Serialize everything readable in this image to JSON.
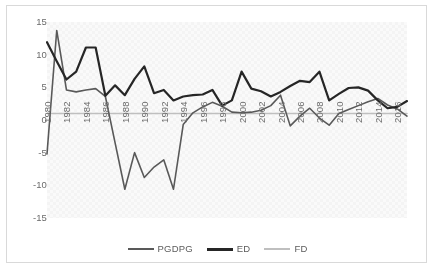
{
  "chart_data": {
    "type": "line",
    "title": "",
    "xlabel": "",
    "ylabel": "",
    "ylim": [
      -15,
      15
    ],
    "y_ticks": [
      15,
      10,
      5,
      0,
      -5,
      -10,
      -15
    ],
    "x_ticks": [
      "1980",
      "1982",
      "1984",
      "1986",
      "1988",
      "1990",
      "1992",
      "1994",
      "1996",
      "1998",
      "2000",
      "2002",
      "2004",
      "2006",
      "2008",
      "2010",
      "2012",
      "2014",
      "2016"
    ],
    "x": [
      1980,
      1981,
      1982,
      1983,
      1984,
      1985,
      1986,
      1987,
      1988,
      1989,
      1990,
      1991,
      1992,
      1993,
      1994,
      1995,
      1996,
      1997,
      1998,
      1999,
      2000,
      2001,
      2002,
      2003,
      2004,
      2005,
      2006,
      2007,
      2008,
      2009,
      2010,
      2011,
      2012,
      2013,
      2014,
      2015,
      2016,
      2017
    ],
    "grid": false,
    "legend_position": "bottom",
    "series": [
      {
        "name": "PGDPG",
        "color": "#595959",
        "width": 1.6,
        "values": [
          -5.2,
          13.7,
          4.6,
          4.3,
          4.6,
          4.8,
          3.6,
          -3.5,
          -10.6,
          -5.0,
          -8.8,
          -7.2,
          -6.1,
          -10.6,
          -0.7,
          1.1,
          2.0,
          2.7,
          2.1,
          1.2,
          1.1,
          1.2,
          1.5,
          2.2,
          3.8,
          -0.9,
          0.6,
          1.8,
          0.3,
          -0.8,
          1.0,
          1.6,
          2.2,
          2.8,
          3.3,
          2.3,
          1.7,
          0.6
        ]
      },
      {
        "name": "ED",
        "color": "#262626",
        "width": 2.2,
        "values": [
          11.9,
          9.0,
          6.2,
          7.4,
          11.1,
          11.1,
          3.7,
          5.3,
          3.8,
          6.3,
          8.2,
          4.1,
          4.6,
          3.0,
          3.6,
          3.8,
          3.9,
          4.6,
          2.2,
          3.0,
          7.4,
          4.8,
          4.4,
          3.6,
          4.3,
          5.2,
          6.0,
          5.8,
          7.4,
          3.0,
          4.0,
          4.9,
          5.0,
          4.5,
          3.0,
          1.8,
          2.0,
          2.9
        ]
      },
      {
        "name": "FD",
        "color": "#bfbfbf",
        "width": 1.6,
        "values": [
          1.0,
          1.0,
          1.0,
          1.0,
          1.0,
          1.0,
          1.0,
          1.0,
          1.0,
          1.0,
          1.0,
          1.0,
          1.0,
          1.0,
          1.0,
          1.0,
          1.0,
          1.0,
          1.0,
          1.0,
          1.0,
          1.0,
          1.0,
          1.0,
          1.0,
          1.0,
          1.0,
          1.0,
          1.0,
          1.0,
          1.0,
          1.0,
          1.0,
          1.0,
          1.0,
          1.0,
          1.0,
          1.0
        ]
      }
    ]
  },
  "legend": {
    "items": [
      {
        "label": "PGDPG",
        "color": "#595959",
        "width": 2
      },
      {
        "label": "ED",
        "color": "#262626",
        "width": 3
      },
      {
        "label": "FD",
        "color": "#bfbfbf",
        "width": 2
      }
    ]
  },
  "colors": {
    "frame_border": "#d9d9d9",
    "plot_background": "#fafafa",
    "axis_text": "#6b6b6b",
    "legend_text": "#5b5b5b"
  }
}
